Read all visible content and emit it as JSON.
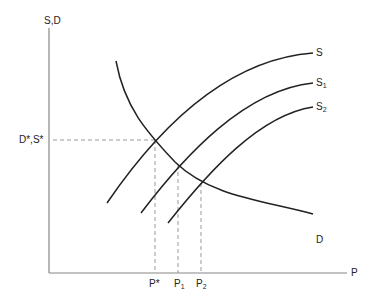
{
  "diagram": {
    "title": "",
    "y_axis_label": "S,D",
    "x_axis_label": "P",
    "equilibrium_label": "D*,S*",
    "curves": [
      {
        "name": "S",
        "label": "S",
        "sub": ""
      },
      {
        "name": "S1",
        "label": "S",
        "sub": "1"
      },
      {
        "name": "S2",
        "label": "S",
        "sub": "2"
      },
      {
        "name": "D",
        "label": "D",
        "sub": ""
      }
    ],
    "x_ticks": [
      {
        "label": "P*",
        "sub": ""
      },
      {
        "label": "P",
        "sub": "1"
      },
      {
        "label": "P",
        "sub": "2"
      }
    ],
    "colors": {
      "curve": "#222222",
      "axis": "#888888",
      "dashed": "#999999"
    }
  }
}
